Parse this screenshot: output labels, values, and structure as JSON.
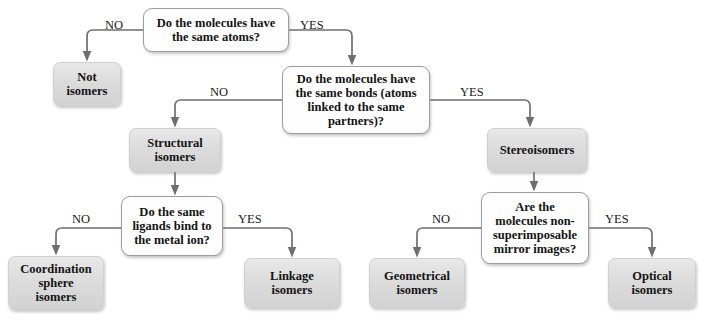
{
  "diagram": {
    "line_color": "#6f6f6f",
    "decision_fill": "#fdfdfd",
    "result_fill": "#dcdcdc",
    "text_color": "#141414"
  },
  "nodes": [
    {
      "id": "q-same-atoms",
      "kind": "decision",
      "text": "Do the molecules have\nthe same atoms?",
      "x": 143,
      "y": 8,
      "w": 146,
      "h": 44
    },
    {
      "id": "not-isomers",
      "kind": "result",
      "text": "Not\nisomers",
      "x": 53,
      "y": 62,
      "w": 68,
      "h": 44
    },
    {
      "id": "q-same-bonds",
      "kind": "decision",
      "text": "Do the molecules have\nthe same bonds (atoms\nlinked to the same\npartners)?",
      "x": 282,
      "y": 66,
      "w": 148,
      "h": 68
    },
    {
      "id": "structural-isomers",
      "kind": "result",
      "text": "Structural\nisomers",
      "x": 129,
      "y": 128,
      "w": 92,
      "h": 44
    },
    {
      "id": "stereoisomers",
      "kind": "result",
      "text": "Stereoisomers",
      "x": 487,
      "y": 128,
      "w": 100,
      "h": 44
    },
    {
      "id": "q-same-ligands",
      "kind": "decision",
      "text": "Do the same\nligands bind to\nthe metal ion?",
      "x": 121,
      "y": 196,
      "w": 102,
      "h": 60
    },
    {
      "id": "q-nonsuperimposable",
      "kind": "decision",
      "text": "Are the\nmolecules non-\nsuperimposable\nmirror images?",
      "x": 481,
      "y": 192,
      "w": 108,
      "h": 72
    },
    {
      "id": "coordination-sphere-isomers",
      "kind": "result",
      "text": "Coordination\nsphere\nisomers",
      "x": 8,
      "y": 256,
      "w": 96,
      "h": 54
    },
    {
      "id": "linkage-isomers",
      "kind": "result",
      "text": "Linkage\nisomers",
      "x": 244,
      "y": 258,
      "w": 96,
      "h": 50
    },
    {
      "id": "geometrical-isomers",
      "kind": "result",
      "text": "Geometrical\nisomers",
      "x": 369,
      "y": 258,
      "w": 96,
      "h": 50
    },
    {
      "id": "optical-isomers",
      "kind": "result",
      "text": "Optical\nisomers",
      "x": 608,
      "y": 258,
      "w": 88,
      "h": 50
    }
  ],
  "edge_labels": [
    {
      "id": "no-1",
      "text": "NO",
      "x": 105,
      "y": 18
    },
    {
      "id": "yes-1",
      "text": "YES",
      "x": 300,
      "y": 18
    },
    {
      "id": "no-2",
      "text": "NO",
      "x": 210,
      "y": 85
    },
    {
      "id": "yes-2",
      "text": "YES",
      "x": 460,
      "y": 85
    },
    {
      "id": "no-3",
      "text": "NO",
      "x": 72,
      "y": 212
    },
    {
      "id": "yes-3",
      "text": "YES",
      "x": 238,
      "y": 212
    },
    {
      "id": "no-4",
      "text": "NO",
      "x": 432,
      "y": 212
    },
    {
      "id": "yes-4",
      "text": "YES",
      "x": 605,
      "y": 212
    }
  ],
  "edges": [
    {
      "id": "edge-same-atoms-no",
      "from": "q-same-atoms",
      "to": "not-isomers",
      "answer": "NO"
    },
    {
      "id": "edge-same-atoms-yes",
      "from": "q-same-atoms",
      "to": "q-same-bonds",
      "answer": "YES"
    },
    {
      "id": "edge-same-bonds-no",
      "from": "q-same-bonds",
      "to": "structural-isomers",
      "answer": "NO"
    },
    {
      "id": "edge-same-bonds-yes",
      "from": "q-same-bonds",
      "to": "stereoisomers",
      "answer": "YES"
    },
    {
      "id": "edge-structural-down",
      "from": "structural-isomers",
      "to": "q-same-ligands",
      "answer": ""
    },
    {
      "id": "edge-stereo-down",
      "from": "stereoisomers",
      "to": "q-nonsuperimposable",
      "answer": ""
    },
    {
      "id": "edge-ligands-no",
      "from": "q-same-ligands",
      "to": "coordination-sphere-isomers",
      "answer": "NO"
    },
    {
      "id": "edge-ligands-yes",
      "from": "q-same-ligands",
      "to": "linkage-isomers",
      "answer": "YES"
    },
    {
      "id": "edge-mirror-no",
      "from": "q-nonsuperimposable",
      "to": "geometrical-isomers",
      "answer": "NO"
    },
    {
      "id": "edge-mirror-yes",
      "from": "q-nonsuperimposable",
      "to": "optical-isomers",
      "answer": "YES"
    }
  ]
}
